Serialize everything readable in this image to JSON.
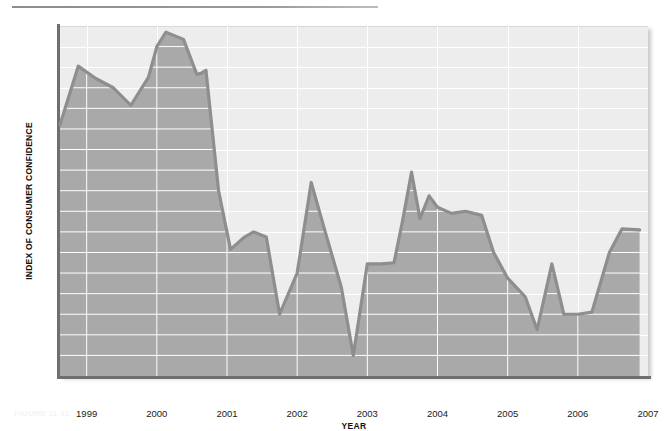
{
  "figure": {
    "caption": "FIGURE 11-11"
  },
  "chart_data": {
    "type": "area",
    "title": "",
    "xlabel": "YEAR",
    "ylabel": "INDEX OF CONSUMER CONFIDENCE",
    "ylim": [
      78,
      112
    ],
    "ytick_step": 2,
    "yticks": [
      78,
      80,
      82,
      84,
      86,
      88,
      90,
      92,
      94,
      96,
      98,
      100,
      102,
      104,
      106,
      108,
      110,
      112
    ],
    "xlim": [
      1998.62,
      2007.0
    ],
    "xticks": [
      1999,
      2000,
      2001,
      2002,
      2003,
      2004,
      2005,
      2006,
      2007
    ],
    "xtick_labels": [
      "1999",
      "2000",
      "2001",
      "2002",
      "2003",
      "2004",
      "2005",
      "2006",
      "2007"
    ],
    "grid": true,
    "legend": false,
    "colors": {
      "line": "#8e8e8e",
      "fill_below": "#a9a9a9",
      "fill_above": "#ededed",
      "gridline": "#ffffff",
      "axis": "#6f6f6f",
      "text": "#1a1a1a"
    },
    "series": [
      {
        "name": "Index of Consumer Confidence",
        "x": [
          1998.62,
          1998.88,
          1999.13,
          1999.38,
          1999.63,
          1999.88,
          2000.0,
          2000.13,
          2000.38,
          2000.57,
          2000.63,
          2000.7,
          2000.88,
          2001.05,
          2001.25,
          2001.38,
          2001.56,
          2001.75,
          2002.0,
          2002.2,
          2002.4,
          2002.63,
          2002.8,
          2003.0,
          2003.2,
          2003.38,
          2003.5,
          2003.63,
          2003.75,
          2003.88,
          2004.0,
          2004.2,
          2004.4,
          2004.63,
          2004.8,
          2005.0,
          2005.25,
          2005.42,
          2005.63,
          2005.8,
          2006.0,
          2006.2,
          2006.45,
          2006.63,
          2006.88
        ],
        "values": [
          102.4,
          108.1,
          106.9,
          106.0,
          104.3,
          107.0,
          110.0,
          111.4,
          110.7,
          107.3,
          107.4,
          107.7,
          96.0,
          90.3,
          91.5,
          92.0,
          91.5,
          84.0,
          88.0,
          96.8,
          92.0,
          86.6,
          80.0,
          88.9,
          88.9,
          89.0,
          93.0,
          97.8,
          93.3,
          95.5,
          94.4,
          93.8,
          94.0,
          93.6,
          90.0,
          87.5,
          85.7,
          82.5,
          88.9,
          84.0,
          84.0,
          84.2,
          90.0,
          92.3,
          92.2
        ]
      }
    ]
  }
}
